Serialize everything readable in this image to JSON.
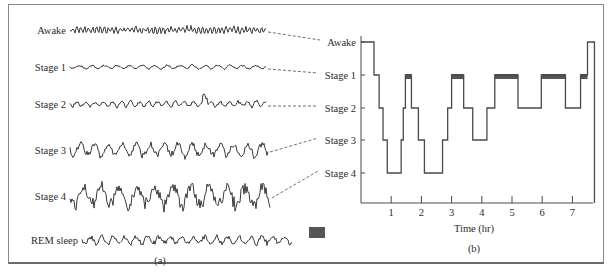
{
  "figure": {
    "panel_a": {
      "caption": "(a)",
      "traces": [
        {
          "label": "Awake",
          "amplitude": 3.5,
          "freq": 1.6,
          "y": 30
        },
        {
          "label": "Stage 1",
          "amplitude": 2.0,
          "freq": 0.5,
          "y": 67
        },
        {
          "label": "Stage 2",
          "amplitude": 3.0,
          "freq": 0.7,
          "y": 104
        },
        {
          "label": "Stage 3",
          "amplitude": 7.0,
          "freq": 0.45,
          "y": 150
        },
        {
          "label": "Stage 4",
          "amplitude": 12.0,
          "freq": 0.35,
          "y": 196
        },
        {
          "label": "REM sleep",
          "amplitude": 4.5,
          "freq": 0.55,
          "y": 240
        }
      ],
      "rem_legend_color": "#555555"
    },
    "panel_b": {
      "caption": "(b)",
      "xlabel": "Time (hr)",
      "stage_labels": [
        "Awake",
        "Stage 1",
        "Stage 2",
        "Stage 3",
        "Stage 4"
      ],
      "x_ticks": [
        "1",
        "2",
        "3",
        "4",
        "5",
        "6",
        "7"
      ]
    }
  },
  "chart_data": {
    "type": "line",
    "xlabel": "Time (hr)",
    "ylabel": "",
    "x_ticks": [
      1,
      2,
      3,
      4,
      5,
      6,
      7
    ],
    "xlim": [
      0,
      7.7
    ],
    "y_levels": [
      "Awake",
      "Stage 1",
      "Stage 2",
      "Stage 3",
      "Stage 4"
    ],
    "step": true,
    "series": [
      {
        "name": "Sleep stage",
        "segments": [
          {
            "start": 0.0,
            "end": 0.43,
            "stage": "Awake"
          },
          {
            "start": 0.43,
            "end": 0.6,
            "stage": "Stage 1"
          },
          {
            "start": 0.6,
            "end": 0.73,
            "stage": "Stage 2"
          },
          {
            "start": 0.73,
            "end": 0.87,
            "stage": "Stage 3"
          },
          {
            "start": 0.87,
            "end": 1.33,
            "stage": "Stage 4"
          },
          {
            "start": 1.33,
            "end": 1.4,
            "stage": "Stage 3"
          },
          {
            "start": 1.4,
            "end": 1.47,
            "stage": "Stage 2"
          },
          {
            "start": 1.47,
            "end": 1.67,
            "stage": "Stage 1",
            "rem": true
          },
          {
            "start": 1.67,
            "end": 1.9,
            "stage": "Stage 2"
          },
          {
            "start": 1.9,
            "end": 2.1,
            "stage": "Stage 3"
          },
          {
            "start": 2.1,
            "end": 2.7,
            "stage": "Stage 4"
          },
          {
            "start": 2.7,
            "end": 2.87,
            "stage": "Stage 3"
          },
          {
            "start": 2.87,
            "end": 3.0,
            "stage": "Stage 2"
          },
          {
            "start": 3.0,
            "end": 3.4,
            "stage": "Stage 1",
            "rem": true
          },
          {
            "start": 3.4,
            "end": 3.7,
            "stage": "Stage 2"
          },
          {
            "start": 3.7,
            "end": 4.17,
            "stage": "Stage 3"
          },
          {
            "start": 4.17,
            "end": 4.43,
            "stage": "Stage 2"
          },
          {
            "start": 4.43,
            "end": 5.2,
            "stage": "Stage 1",
            "rem": true
          },
          {
            "start": 5.2,
            "end": 5.97,
            "stage": "Stage 2"
          },
          {
            "start": 5.97,
            "end": 6.77,
            "stage": "Stage 1",
            "rem": true
          },
          {
            "start": 6.77,
            "end": 7.27,
            "stage": "Stage 2"
          },
          {
            "start": 7.27,
            "end": 7.5,
            "stage": "Stage 1",
            "rem": true
          },
          {
            "start": 7.5,
            "end": 7.73,
            "stage": "Awake"
          }
        ]
      }
    ],
    "legend": [
      {
        "label": "REM sleep",
        "marker": "dark filled rectangle"
      }
    ],
    "grid": false
  }
}
